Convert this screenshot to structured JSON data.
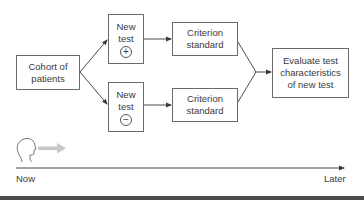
{
  "diagram": {
    "nodes": {
      "cohort": {
        "line1": "Cohort of",
        "line2": "patients"
      },
      "new_test_positive": {
        "line1": "New",
        "line2": "test",
        "sign": "+"
      },
      "new_test_negative": {
        "line1": "New",
        "line2": "test",
        "sign": "−"
      },
      "criterion_top": {
        "line1": "Criterion",
        "line2": "standard"
      },
      "criterion_bottom": {
        "line1": "Criterion",
        "line2": "standard"
      },
      "evaluate": {
        "line1": "Evaluate test",
        "line2": "characteristics",
        "line3": "of new test"
      }
    },
    "edges": [
      {
        "from": "cohort",
        "to": "new_test_positive"
      },
      {
        "from": "cohort",
        "to": "new_test_negative"
      },
      {
        "from": "new_test_positive",
        "to": "criterion_top"
      },
      {
        "from": "new_test_negative",
        "to": "criterion_bottom"
      },
      {
        "from": "criterion_top",
        "to": "evaluate"
      },
      {
        "from": "criterion_bottom",
        "to": "evaluate"
      }
    ],
    "timeline": {
      "start_label": "Now",
      "end_label": "Later",
      "observer_icon": "head-profile-icon",
      "direction_icon": "gray-arrow-icon"
    },
    "colors": {
      "line": "#4a4a4a",
      "box_border": "#6a6a6a",
      "text": "#3a3a3a",
      "gray_arrow": "#c8c8c8"
    }
  }
}
